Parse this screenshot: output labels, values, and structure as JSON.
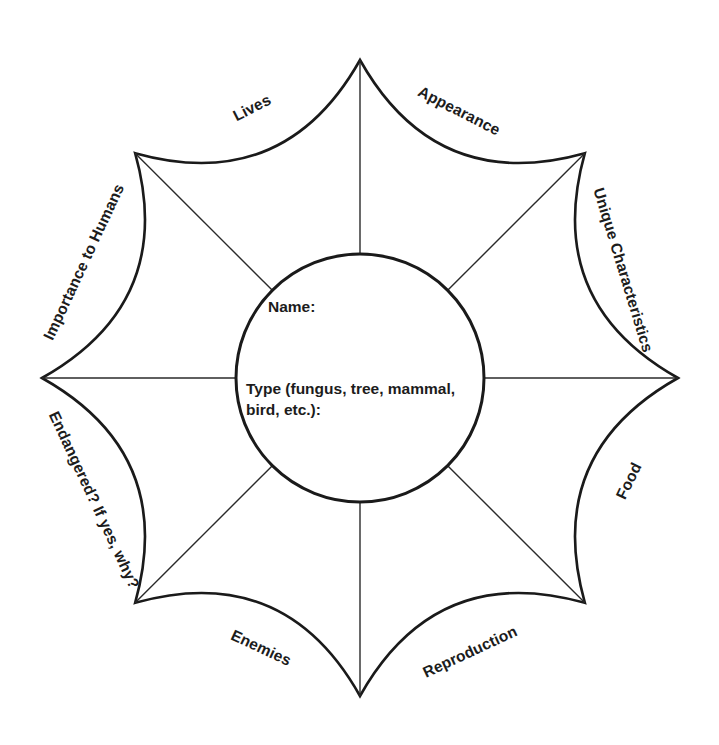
{
  "worksheet": {
    "title": "Species Study Flower Organizer",
    "shape": "eight-petal flower diagram",
    "ink_color": "#1a1a1a",
    "background_color": "#ffffff"
  },
  "center": {
    "name_label": "Name:",
    "type_label": "Type (fungus, tree, mammal, bird, etc.):"
  },
  "petals": [
    {
      "id": "lives",
      "label": "Lives",
      "angle_deg": -67.5,
      "text_rotation_deg": -27,
      "x": 252,
      "y": 108
    },
    {
      "id": "appearance",
      "label": "Appearance",
      "angle_deg": -22.5,
      "text_rotation_deg": 27,
      "x": 459,
      "y": 111
    },
    {
      "id": "unique-characteristics",
      "label": "Unique Characteristics",
      "angle_deg": 22.5,
      "text_rotation_deg": 73,
      "x": 623,
      "y": 270
    },
    {
      "id": "food",
      "label": "Food",
      "angle_deg": 67.5,
      "text_rotation_deg": -64,
      "x": 629,
      "y": 481
    },
    {
      "id": "reproduction",
      "label": "Reproduction",
      "angle_deg": 112.5,
      "text_rotation_deg": -25,
      "x": 470,
      "y": 652
    },
    {
      "id": "enemies",
      "label": "Enemies",
      "angle_deg": 157.5,
      "text_rotation_deg": 25,
      "x": 261,
      "y": 648
    },
    {
      "id": "endangered",
      "label": "Endangered?  If yes, why?",
      "angle_deg": -157.5,
      "text_rotation_deg": 65,
      "x": 94,
      "y": 500
    },
    {
      "id": "importance-to-humans",
      "label": "Importance to Humans",
      "angle_deg": -112.5,
      "text_rotation_deg": -65,
      "x": 84,
      "y": 262
    }
  ],
  "geometry": {
    "center_x": 360,
    "center_y": 378,
    "outer_radius": 318,
    "inner_radius": 124,
    "petal_count": 8,
    "arc_inset": 72
  }
}
